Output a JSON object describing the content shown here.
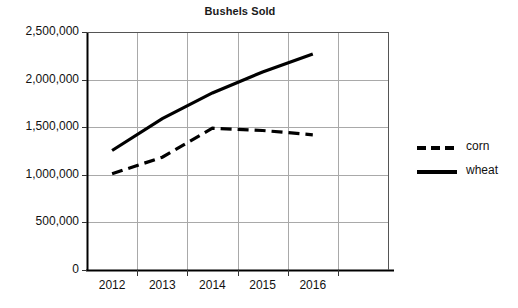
{
  "chart_data": {
    "type": "line",
    "title": "Bushels Sold",
    "xlabel": "",
    "ylabel": "",
    "categories": [
      "2012",
      "2013",
      "2014",
      "2015",
      "2016"
    ],
    "x": [
      2012,
      2013,
      2014,
      2015,
      2016
    ],
    "xlim": [
      2011.5,
      2016.5
    ],
    "ylim": [
      0,
      2500000
    ],
    "grid": "horizontal-and-vertical",
    "legend_position": "right",
    "ytick_labels": [
      "2,500,000",
      "2,000,000",
      "1,500,000",
      "1,000,000",
      "500,000",
      "0"
    ],
    "ytick_values": [
      2500000,
      2000000,
      1500000,
      1000000,
      500000,
      0
    ],
    "series": [
      {
        "name": "corn",
        "style": "dashed",
        "color": "#000000",
        "values": [
          1010000,
          1185000,
          1490000,
          1465000,
          1420000
        ]
      },
      {
        "name": "wheat",
        "style": "solid",
        "color": "#000000",
        "values": [
          1255000,
          1590000,
          1860000,
          2080000,
          2270000
        ]
      }
    ]
  },
  "legend": {
    "items": [
      {
        "label": "corn",
        "style": "dashed",
        "icon": "dashed-line-icon"
      },
      {
        "label": "wheat",
        "style": "solid",
        "icon": "solid-line-icon"
      }
    ]
  }
}
